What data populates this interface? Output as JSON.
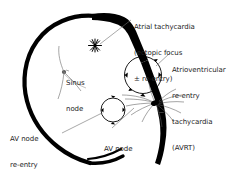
{
  "figure": {
    "type": "medical-diagram",
    "background_color": "#ffffff",
    "ink_color": "#000000",
    "text_color": "#242424"
  },
  "labels": {
    "atrial_tachycardia": {
      "line1": "Atrial tachycardia",
      "line2": "(ectopic focus",
      "line3": "± re-entry)"
    },
    "avrt": {
      "line1": "Atrioventricular",
      "line2": "re-entry",
      "line3": "tachycardia",
      "line4": "(AVRT)"
    },
    "avnrt": {
      "line1": "AV node",
      "line2": "re-entry",
      "line3": "tachycardia",
      "line4": "(AVNRT)"
    },
    "av_node": {
      "line1": "AV node"
    },
    "sinus_node": {
      "line1": "Sinus",
      "line2": "node"
    }
  },
  "markers": {
    "ectopic_focus_icon": "starburst-icon",
    "avrt_loop_icon": "reentry-circle-icon",
    "avnrt_loop_icon": "reentry-circle-icon",
    "av_node_icon": "purkinje-fan-icon",
    "sinus_node_icon": "sinus-node-dot-icon"
  }
}
